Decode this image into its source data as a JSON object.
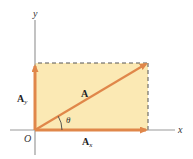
{
  "diagram": {
    "colors": {
      "vector": "#e0874a",
      "rect_fill": "#fbe9b4",
      "axis": "#9a9a9a",
      "dashed": "#555555"
    },
    "axes": {
      "x_label": "x",
      "y_label": "y",
      "origin_label": "O"
    },
    "vectors": {
      "main": {
        "label": "A"
      },
      "x_component": {
        "label": "A",
        "subscript": "x"
      },
      "y_component": {
        "label": "A",
        "subscript": "y"
      }
    },
    "angle": {
      "label": "θ"
    }
  }
}
